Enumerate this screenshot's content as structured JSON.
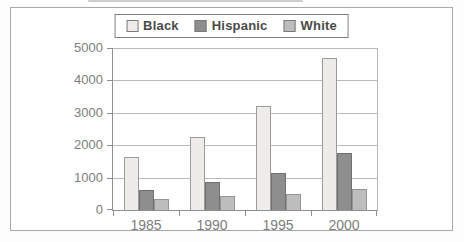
{
  "figure": {
    "background": "#ffffff",
    "frame_border_color": "#a8a8a8",
    "gridline_color": "#b8b8b8",
    "axis_color": "#8f8f8f",
    "tick_label_color": "#7d7d7d",
    "legend_text_color": "#4a4a4a"
  },
  "chart_data": {
    "type": "bar",
    "title": "",
    "xlabel": "",
    "ylabel": "",
    "categories": [
      "1985",
      "1990",
      "1995",
      "2000"
    ],
    "series": [
      {
        "name": "Black",
        "fill": "#edece9",
        "stroke": "#9a9a9a",
        "values": [
          1650,
          2250,
          3200,
          4700
        ]
      },
      {
        "name": "Hispanic",
        "fill": "#8e8e8e",
        "stroke": "#707070",
        "values": [
          620,
          850,
          1150,
          1750
        ]
      },
      {
        "name": "White",
        "fill": "#bdbdbd",
        "stroke": "#949494",
        "values": [
          350,
          420,
          500,
          650
        ]
      }
    ],
    "ylim": [
      0,
      5000
    ],
    "yticks": [
      0,
      1000,
      2000,
      3000,
      4000,
      5000
    ],
    "grid": true,
    "legend_position": "top-center"
  }
}
